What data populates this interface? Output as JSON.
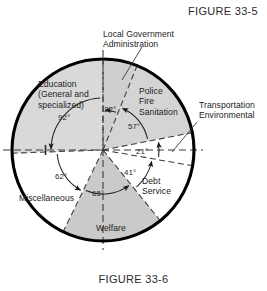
{
  "figure": {
    "top_caption": "FIGURE 33-5",
    "bottom_caption": "FIGURE 33-6"
  },
  "chart_data": {
    "type": "pie",
    "title": "FIGURE 33-6",
    "xlabel": "",
    "ylabel": "",
    "units": "degrees",
    "total_degrees": 360,
    "grid": false,
    "legend": "none",
    "note": "Municipal budget allocation circle graph; sector angles in degrees measured clockwise from the vertical (12 o'clock) axis.",
    "start_angle_deg": 0,
    "direction": "clockwise",
    "categories": [
      "Local Government Administration",
      "Police Fire Sanitation",
      "Transportation Environmental",
      "Debt Service",
      "Welfare",
      "Miscellaneous",
      "Education (General and specialized)"
    ],
    "values": [
      22,
      57,
      21,
      41,
      65,
      62,
      92
    ],
    "slices": [
      {
        "name": "Local Government Administration",
        "label_lines": [
          "Local Government",
          "Administration"
        ],
        "angle_deg": 22,
        "angle_label": "22°",
        "start_deg": 0,
        "end_deg": 22,
        "fill": "#cfcfcf",
        "shaded": true,
        "callout": true
      },
      {
        "name": "Police Fire Sanitation",
        "label_lines": [
          "Police",
          "Fire",
          "Sanitation"
        ],
        "angle_deg": 57,
        "angle_label": "57°",
        "start_deg": 22,
        "end_deg": 79,
        "fill": "#d4d4d4",
        "shaded": true,
        "callout": false
      },
      {
        "name": "Transportation Environmental",
        "label_lines": [
          "Transportation",
          "Environmental"
        ],
        "angle_deg": 21,
        "angle_label": "21°",
        "start_deg": 79,
        "end_deg": 100,
        "fill": "#ffffff",
        "shaded": false,
        "callout": true
      },
      {
        "name": "Debt Service",
        "label_lines": [
          "Debt",
          "Service"
        ],
        "angle_deg": 41,
        "angle_label": "41°",
        "start_deg": 100,
        "end_deg": 141,
        "fill": "#ffffff",
        "shaded": false,
        "callout": false
      },
      {
        "name": "Welfare",
        "label_lines": [
          "Welfare"
        ],
        "angle_deg": 65,
        "angle_label": "65°",
        "start_deg": 141,
        "end_deg": 206,
        "fill": "#cacaca",
        "shaded": true,
        "callout": false
      },
      {
        "name": "Miscellaneous",
        "label_lines": [
          "Miscellaneous"
        ],
        "angle_deg": 62,
        "angle_label": "62°",
        "start_deg": 206,
        "end_deg": 268,
        "fill": "#ffffff",
        "shaded": false,
        "callout": false
      },
      {
        "name": "Education (General and specialized)",
        "label_lines": [
          "Education",
          "(General and",
          "specialized)"
        ],
        "angle_deg": 92,
        "angle_label": "92°",
        "start_deg": 268,
        "end_deg": 360,
        "fill": "#d9d9d9",
        "shaded": true,
        "callout": false
      }
    ],
    "angle_labels": [
      "22°",
      "57°",
      "21°",
      "41°",
      "65°",
      "62°",
      "92°"
    ],
    "colors": {
      "outline": "#000000",
      "dashed_rule": "#3a3a3a",
      "text": "#1c1c1c",
      "shade_light": "#d9d9d9",
      "shade_mid": "#cfcfcf",
      "white": "#ffffff"
    }
  }
}
